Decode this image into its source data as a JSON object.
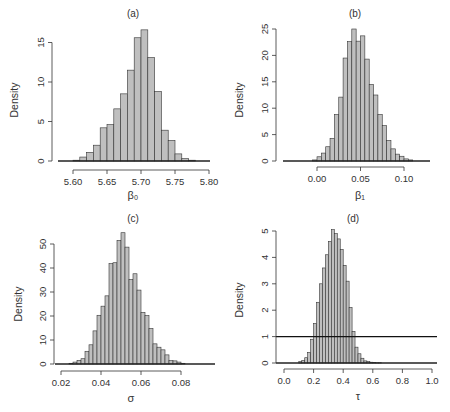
{
  "chart_data": [
    {
      "type": "bar",
      "panel": "(a)",
      "title": "(a)",
      "xlabel": "β₀",
      "ylabel": "Density",
      "xlim": [
        5.58,
        5.81
      ],
      "ylim": [
        0,
        17
      ],
      "xticks": [
        5.6,
        5.65,
        5.7,
        5.75,
        5.8
      ],
      "xtick_labels": [
        "5.60",
        "5.65",
        "5.70",
        "5.75",
        "5.80"
      ],
      "yticks": [
        0,
        5,
        10,
        15
      ],
      "ytick_labels": [
        "0",
        "5",
        "10",
        "15"
      ],
      "bin_start": 5.6,
      "bin_width": 0.01,
      "values": [
        0.1,
        0.5,
        1.1,
        2.0,
        4.2,
        4.6,
        6.6,
        8.5,
        11.5,
        15.6,
        16.6,
        13.1,
        8.8,
        3.9,
        2.6,
        0.9,
        0.3,
        0.1
      ],
      "grid": false,
      "reference_line": null
    },
    {
      "type": "bar",
      "panel": "(b)",
      "title": "(b)",
      "xlabel": "β₁",
      "ylabel": "Density",
      "xlim": [
        -0.04,
        0.13
      ],
      "ylim": [
        0,
        25
      ],
      "xticks": [
        0.0,
        0.05,
        0.1
      ],
      "xtick_labels": [
        "0.00",
        "0.05",
        "0.10"
      ],
      "yticks": [
        0,
        5,
        10,
        15,
        20,
        25
      ],
      "ytick_labels": [
        "0",
        "5",
        "10",
        "15",
        "20",
        "25"
      ],
      "bin_start": -0.005,
      "bin_width": 0.005,
      "values": [
        0.2,
        0.8,
        1.5,
        2.7,
        4.3,
        8.8,
        12.1,
        19.5,
        22.6,
        25.0,
        22.7,
        23.7,
        19.3,
        14.5,
        12.5,
        8.8,
        6.7,
        3.9,
        2.3,
        1.3,
        0.9,
        0.4,
        0.2
      ],
      "grid": false,
      "reference_line": null
    },
    {
      "type": "bar",
      "panel": "(c)",
      "title": "(c)",
      "xlabel": "σ",
      "ylabel": "Density",
      "xlim": [
        0.017,
        0.097
      ],
      "ylim": [
        0,
        52
      ],
      "xticks": [
        0.02,
        0.04,
        0.06,
        0.08
      ],
      "xtick_labels": [
        "0.02",
        "0.04",
        "0.06",
        "0.08"
      ],
      "yticks": [
        0,
        10,
        20,
        30,
        40,
        50
      ],
      "ytick_labels": [
        "0",
        "10",
        "20",
        "30",
        "40",
        "50"
      ],
      "bin_start": 0.024,
      "bin_width": 0.002,
      "values": [
        0.3,
        0.8,
        1.5,
        2.2,
        5.3,
        8.0,
        13.8,
        20.3,
        24.1,
        28.4,
        41.8,
        42.2,
        51.5,
        54.7,
        48.7,
        35.2,
        37.6,
        30.8,
        21.5,
        20.2,
        14.8,
        8.4,
        7.0,
        5.9,
        3.8,
        1.4,
        1.3,
        0.8,
        0.3
      ],
      "grid": false,
      "reference_line": null
    },
    {
      "type": "bar",
      "panel": "(d)",
      "title": "(d)",
      "xlabel": "τ",
      "ylabel": "Density",
      "xlim": [
        0.0,
        1.05
      ],
      "ylim": [
        0,
        5
      ],
      "xticks": [
        0.0,
        0.2,
        0.4,
        0.6,
        0.8,
        1.0
      ],
      "xtick_labels": [
        "0.0",
        "0.2",
        "0.4",
        "0.6",
        "0.8",
        "1.0"
      ],
      "yticks": [
        0,
        1,
        2,
        3,
        4,
        5
      ],
      "ytick_labels": [
        "0",
        "1",
        "2",
        "3",
        "4",
        "5"
      ],
      "bin_start": 0.1,
      "bin_width": 0.02,
      "values": [
        0.05,
        0.1,
        0.2,
        0.4,
        0.9,
        1.5,
        2.3,
        3.0,
        3.6,
        4.1,
        4.6,
        5.05,
        4.9,
        4.7,
        4.3,
        3.7,
        3.1,
        2.1,
        1.2,
        0.6,
        0.35,
        0.18,
        0.08,
        0.05,
        0.03,
        0.02,
        0.01,
        0.01
      ],
      "grid": false,
      "reference_line": {
        "y": 1,
        "label": "uniform prior density"
      }
    }
  ],
  "colors": {
    "bar_fill": "#bfbfbf",
    "bar_stroke": "#333333",
    "axis": "#333333",
    "background": "#ffffff"
  },
  "labels": {
    "a": {
      "title": "(a)",
      "xlabel": "β₀",
      "ylabel": "Density"
    },
    "b": {
      "title": "(b)",
      "xlabel": "β₁",
      "ylabel": "Density"
    },
    "c": {
      "title": "(c)",
      "xlabel": "σ",
      "ylabel": "Density"
    },
    "d": {
      "title": "(d)",
      "xlabel": "τ",
      "ylabel": "Density"
    }
  }
}
